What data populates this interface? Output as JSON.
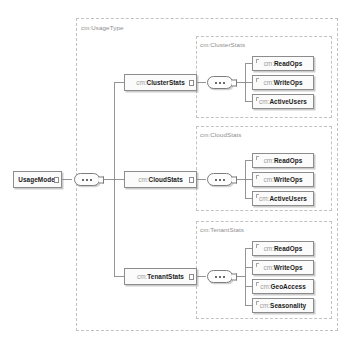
{
  "diagram": {
    "type": "xml-schema-tree",
    "outer_group_label": "cm:UsageType",
    "root": {
      "label": "UsageModel",
      "namespace": "",
      "name": "UsageModel"
    },
    "compositor_icon": "sequence-compositor-icon",
    "branches": [
      {
        "group_label": "cm:ClusterStats",
        "node": {
          "namespace": "cm:",
          "name": "ClusterStats"
        },
        "children": [
          {
            "namespace": "cm:",
            "name": "ReadOps"
          },
          {
            "namespace": "cm:",
            "name": "WriteOps"
          },
          {
            "namespace": "cm:",
            "name": "ActiveUsers"
          }
        ]
      },
      {
        "group_label": "cm:CloudStats",
        "node": {
          "namespace": "cm:",
          "name": "CloudStats"
        },
        "children": [
          {
            "namespace": "cm:",
            "name": "ReadOps"
          },
          {
            "namespace": "cm:",
            "name": "WriteOps"
          },
          {
            "namespace": "cm:",
            "name": "ActiveUsers"
          }
        ]
      },
      {
        "group_label": "cm:TenantStats",
        "node": {
          "namespace": "cm:",
          "name": "TenantStats"
        },
        "children": [
          {
            "namespace": "cm:",
            "name": "ReadOps"
          },
          {
            "namespace": "cm:",
            "name": "WriteOps"
          },
          {
            "namespace": "cm:",
            "name": "GeoAccess"
          },
          {
            "namespace": "cm:",
            "name": "Seasonality"
          }
        ]
      }
    ],
    "colors": {
      "background": "#ffffff",
      "node_fill": "#fbfbfb",
      "node_border": "#8c8c8c",
      "group_border": "#c2c2c2",
      "group_label": "#8d8d8d",
      "namespace_text": "#9b9b9b",
      "name_text": "#1a1a1a",
      "wire": "#8a8a8a"
    }
  }
}
